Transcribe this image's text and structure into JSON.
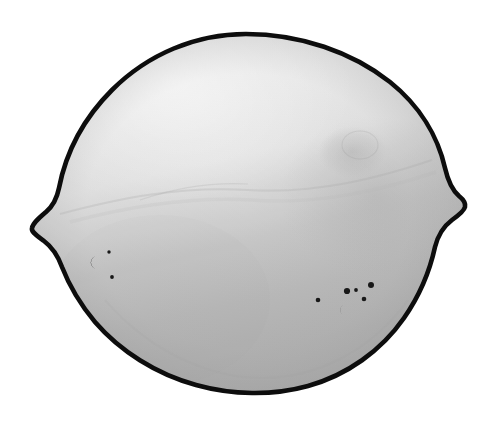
{
  "image": {
    "kind": "photograph",
    "subject": "lemon",
    "subject_label": "Lemon",
    "description": "Grayscale photograph of a whole lemon seen from the side, outlined with a thick black contour on a plain white background.",
    "orientation": "landscape",
    "width_px": 495,
    "height_px": 422,
    "color_mode": "grayscale"
  },
  "colors": {
    "background": "#ffffff",
    "outline": "#0d0d0d",
    "body_highlight": "#f2f2f2",
    "body_upper": "#e8e8e8",
    "body_mid": "#cfcfcf",
    "body_lower": "#b4b4b4",
    "body_shadow": "#a8a8a8",
    "blemish": "#141414",
    "contour_line": "#bcbcbc"
  },
  "shape": {
    "outline_width_px": 4,
    "bounds": {
      "left": 30,
      "top": 33,
      "right": 466,
      "bottom": 392
    },
    "left_tip": {
      "x": 32,
      "y": 228
    },
    "right_nub": {
      "x": 465,
      "y": 206
    },
    "top_apex": {
      "x": 246,
      "y": 34
    },
    "bottom_apex": {
      "x": 252,
      "y": 390
    }
  },
  "shading": {
    "light_direction": "top-left",
    "top_value": "#f4f4f4",
    "bottom_value": "#b0b0b0",
    "equator_y": 196,
    "contour_band_label": "faint horizontal surface contour"
  },
  "blemishes": {
    "left_cluster": {
      "label": "left rind spot cluster",
      "spots": [
        {
          "name": "c-shaped-mark",
          "cx": 94,
          "cy": 262,
          "rx": 5.0,
          "ry": 5.6,
          "shape": "crescent"
        },
        {
          "name": "dot-upper-right",
          "cx": 109,
          "cy": 252,
          "rx": 1.7,
          "ry": 1.7,
          "shape": "dot"
        },
        {
          "name": "dot-lower",
          "cx": 112,
          "cy": 277,
          "rx": 1.9,
          "ry": 1.9,
          "shape": "dot"
        }
      ]
    },
    "right_cluster": {
      "label": "right rind spot cluster",
      "spots": [
        {
          "name": "dot-far-left",
          "cx": 318,
          "cy": 300,
          "rx": 2.3,
          "ry": 2.3,
          "shape": "dot"
        },
        {
          "name": "dot-left-pair-a",
          "cx": 347,
          "cy": 291,
          "rx": 3.1,
          "ry": 3.1,
          "shape": "dot"
        },
        {
          "name": "dot-left-pair-b",
          "cx": 356,
          "cy": 290,
          "rx": 1.9,
          "ry": 1.9,
          "shape": "dot"
        },
        {
          "name": "dot-upper-right",
          "cx": 371,
          "cy": 285,
          "rx": 3.0,
          "ry": 3.0,
          "shape": "dot"
        },
        {
          "name": "dot-mid-right",
          "cx": 364,
          "cy": 299,
          "rx": 2.3,
          "ry": 2.3,
          "shape": "dot"
        },
        {
          "name": "c-shaped-mark",
          "cx": 342,
          "cy": 310,
          "rx": 4.4,
          "ry": 4.8,
          "shape": "crescent"
        }
      ]
    }
  },
  "surface_marks": [
    {
      "name": "upper-right-scar",
      "cx": 352,
      "cy": 152,
      "rx": 30,
      "ry": 22,
      "opacity": 0.1
    },
    {
      "name": "right-shoulder-shade",
      "cx": 375,
      "cy": 196,
      "rx": 60,
      "ry": 42,
      "opacity": 0.1
    },
    {
      "name": "mid-contour-arc",
      "cx": 247,
      "cy": 205,
      "rx": 150,
      "ry": 40,
      "opacity": 0.12
    },
    {
      "name": "lower-left-wash",
      "cx": 150,
      "cy": 300,
      "rx": 90,
      "ry": 70,
      "opacity": 0.06
    }
  ]
}
